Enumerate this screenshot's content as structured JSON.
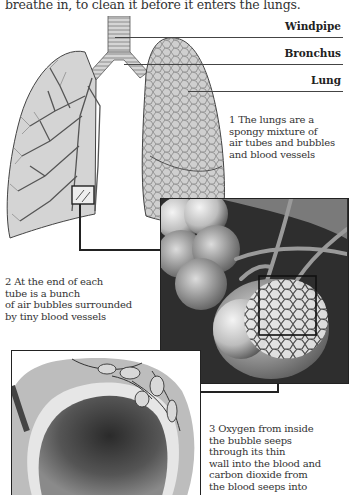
{
  "intro_text": "breathe in, to clean it before it enters the lungs.",
  "labels": {
    "windpipe": "Windpipe",
    "bronchus": "Bronchus",
    "lung": "Lung"
  },
  "captions": [
    {
      "number": "1",
      "lines": [
        "1 The lungs are a",
        "spongy mixture of",
        "air tubes and bubbles",
        "and blood vessels"
      ]
    },
    {
      "number": "2",
      "lines": [
        "2 At the end of each",
        "tube is a bunch",
        "of air bubbles surrounded",
        "by tiny blood vessels"
      ]
    },
    {
      "number": "3",
      "lines": [
        "3 Oxygen from inside",
        "the bubble seeps",
        "through its thin",
        "wall into the blood and",
        "carbon dioxide from",
        "the blood seeps into"
      ]
    }
  ],
  "colors": {
    "ink": "#222222",
    "lung_fill": "#c9c9c9",
    "dark_bg": "#2b2b2b"
  }
}
